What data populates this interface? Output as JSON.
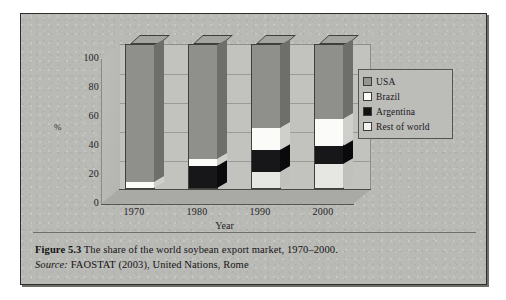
{
  "figure": {
    "caption_number": "Figure 5.3",
    "caption_text": "The share of the world soybean export market, 1970–2000.",
    "source_label": "Source:",
    "source_text": "FAOSTAT (2003), United Nations, Rome"
  },
  "chart_data": {
    "type": "bar",
    "subtype": "stacked-100-3d",
    "title": "",
    "xlabel": "Year",
    "ylabel": "%",
    "categories": [
      "1970",
      "1980",
      "1990",
      "2000"
    ],
    "x_tick_labels": [
      "1970",
      "1980",
      "1990",
      "2000"
    ],
    "y_tick_labels": [
      "0",
      "20",
      "40",
      "60",
      "80",
      "100"
    ],
    "ylim": [
      0,
      100
    ],
    "grid": true,
    "legend_position": "right",
    "series": [
      {
        "name": "USA",
        "color": "#8f8f8c",
        "values": [
          95,
          79,
          58,
          52
        ]
      },
      {
        "name": "Brazil",
        "color": "#fbfbf9",
        "values": [
          5,
          5,
          15,
          18
        ]
      },
      {
        "name": "Argentina",
        "color": "#17171a",
        "values": [
          0,
          16,
          15,
          13
        ]
      },
      {
        "name": "Rest of world",
        "color": "#e6e6e2",
        "values": [
          0,
          0,
          12,
          17
        ]
      }
    ],
    "stack_order_bottom_to_top": [
      "Rest of world",
      "Argentina",
      "Brazil",
      "USA"
    ]
  },
  "legend": {
    "items": [
      {
        "label": "USA",
        "swatch": "usa"
      },
      {
        "label": "Brazil",
        "swatch": "bra"
      },
      {
        "label": "Argentina",
        "swatch": "arg"
      },
      {
        "label": "Rest of world",
        "swatch": "row"
      }
    ]
  }
}
